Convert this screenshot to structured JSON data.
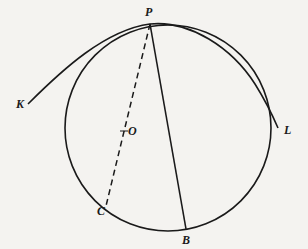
{
  "diagram": {
    "type": "geometry",
    "colors": {
      "ink": "#1a1a1a",
      "background": "#f4f3f0"
    },
    "points": {
      "P": {
        "label": "P",
        "x": 150,
        "y": 24
      },
      "K": {
        "label": "K",
        "x": 28,
        "y": 104
      },
      "L": {
        "label": "L",
        "x": 278,
        "y": 128
      },
      "O": {
        "label": "O",
        "x": 124,
        "y": 131
      },
      "C": {
        "label": "C",
        "x": 106,
        "y": 207
      },
      "B": {
        "label": "B",
        "x": 186,
        "y": 230
      }
    },
    "circle": {
      "cx": 168,
      "cy": 128,
      "r": 103
    },
    "segments": [
      {
        "from": "P",
        "to": "B",
        "style": "solid"
      },
      {
        "from": "P",
        "to": "C",
        "style": "dashed"
      }
    ],
    "curve": {
      "through": [
        "K",
        "P",
        "L"
      ],
      "style": "solid"
    }
  }
}
